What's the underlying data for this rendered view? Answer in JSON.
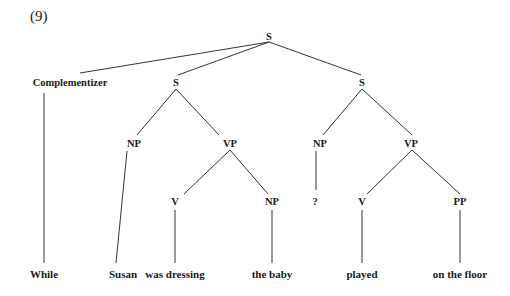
{
  "example_number": "(9)",
  "tree": {
    "nodes": [
      {
        "id": "root",
        "label": "S",
        "x": 269,
        "y": 36
      },
      {
        "id": "comp",
        "label": "Complementizer",
        "x": 70,
        "y": 82
      },
      {
        "id": "s1",
        "label": "S",
        "x": 176,
        "y": 82
      },
      {
        "id": "s2",
        "label": "S",
        "x": 362,
        "y": 82
      },
      {
        "id": "np1",
        "label": "NP",
        "x": 134,
        "y": 143
      },
      {
        "id": "vp1",
        "label": "VP",
        "x": 230,
        "y": 143
      },
      {
        "id": "np3",
        "label": "NP",
        "x": 320,
        "y": 143
      },
      {
        "id": "vp2",
        "label": "VP",
        "x": 411,
        "y": 143
      },
      {
        "id": "v1",
        "label": "V",
        "x": 175,
        "y": 201
      },
      {
        "id": "np2",
        "label": "NP",
        "x": 272,
        "y": 201
      },
      {
        "id": "q",
        "label": "?",
        "x": 315,
        "y": 201
      },
      {
        "id": "v2",
        "label": "V",
        "x": 362,
        "y": 201
      },
      {
        "id": "pp",
        "label": "PP",
        "x": 460,
        "y": 201
      }
    ],
    "leaves": [
      {
        "id": "w1",
        "label": "While",
        "x": 44,
        "y": 274
      },
      {
        "id": "w2",
        "label": "Susan",
        "x": 123,
        "y": 274
      },
      {
        "id": "w3",
        "label": "was dressing",
        "x": 175,
        "y": 274
      },
      {
        "id": "w4",
        "label": "the baby",
        "x": 272,
        "y": 274
      },
      {
        "id": "w5",
        "label": "played",
        "x": 362,
        "y": 274
      },
      {
        "id": "w6",
        "label": "on the floor",
        "x": 460,
        "y": 274
      }
    ],
    "edges": [
      [
        269,
        42,
        80,
        73
      ],
      [
        269,
        42,
        178,
        75
      ],
      [
        269,
        42,
        361,
        75
      ],
      [
        44,
        93,
        44,
        263
      ],
      [
        176,
        89,
        137,
        135
      ],
      [
        176,
        89,
        219,
        135
      ],
      [
        362,
        89,
        323,
        135
      ],
      [
        362,
        89,
        412,
        135
      ],
      [
        127,
        151,
        116,
        263
      ],
      [
        230,
        150,
        184,
        194
      ],
      [
        230,
        150,
        268,
        194
      ],
      [
        316,
        151,
        316,
        190
      ],
      [
        412,
        150,
        367,
        194
      ],
      [
        412,
        150,
        460,
        194
      ],
      [
        175,
        210,
        175,
        263
      ],
      [
        272,
        210,
        272,
        263
      ],
      [
        362,
        210,
        362,
        263
      ],
      [
        460,
        210,
        460,
        263
      ]
    ]
  }
}
